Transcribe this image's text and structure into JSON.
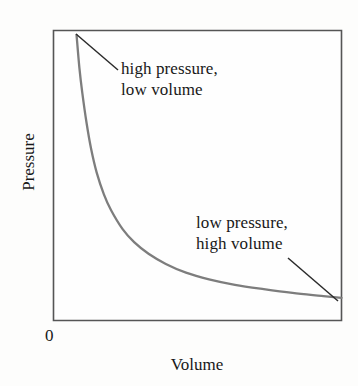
{
  "figure": {
    "axis_x_label": "Volume",
    "axis_y_label": "Pressure",
    "origin_label": "0",
    "annotation_high_line1": "high pressure,",
    "annotation_high_line2": "low volume",
    "annotation_low_line1": "low pressure,",
    "annotation_low_line2": "high volume"
  },
  "colors": {
    "curve": "#7d7d7d",
    "frame": "#555555",
    "leader": "#2b2b2b",
    "text": "#181818",
    "background": "#fdfdfc"
  },
  "chart_data": {
    "type": "line",
    "title": "",
    "subtitle": "",
    "xlabel": "Volume",
    "ylabel": "Pressure",
    "xlim": [
      0,
      10
    ],
    "ylim": [
      0,
      10
    ],
    "grid": false,
    "legend": "none",
    "tick_labels_x": [
      "0"
    ],
    "tick_labels_y": [],
    "relationship": "inverse (P proportional to 1/V)",
    "series": [
      {
        "name": "Pressure vs Volume",
        "x": [
          0.8,
          0.9,
          1.0,
          1.15,
          1.3,
          1.5,
          1.75,
          2.0,
          2.4,
          2.8,
          3.3,
          3.9,
          4.6,
          5.4,
          6.3,
          7.3,
          8.3,
          9.3,
          10.0
        ],
        "y": [
          9.85,
          8.7,
          7.85,
          6.8,
          5.95,
          5.1,
          4.35,
          3.8,
          3.15,
          2.7,
          2.3,
          1.95,
          1.65,
          1.42,
          1.23,
          1.08,
          0.95,
          0.85,
          0.78
        ]
      }
    ],
    "annotations": [
      {
        "text": "high pressure, low volume",
        "points_to": {
          "x": 0.8,
          "y": 9.85
        },
        "position": "upper-left"
      },
      {
        "text": "low pressure, high volume",
        "points_to": {
          "x": 10.0,
          "y": 0.78
        },
        "position": "lower-right"
      }
    ]
  }
}
